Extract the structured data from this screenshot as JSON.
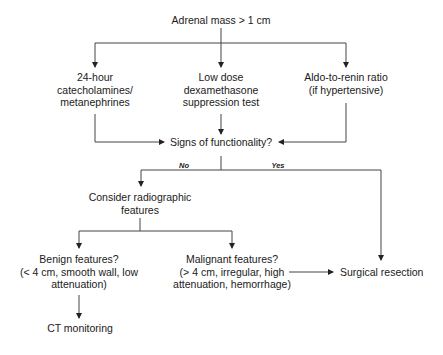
{
  "diagram": {
    "type": "flowchart",
    "nodes": {
      "start": {
        "lines": [
          "Adrenal mass > 1 cm"
        ]
      },
      "catechol": {
        "lines": [
          "24-hour",
          "catecholamines/",
          "metanephrines"
        ]
      },
      "dexa": {
        "lines": [
          "Low dose",
          "dexamethasone",
          "suppression test"
        ]
      },
      "aldo": {
        "lines": [
          "Aldo-to-renin ratio",
          "(if hypertensive)"
        ]
      },
      "functionality": {
        "lines": [
          "Signs of functionality?"
        ]
      },
      "radiographic": {
        "lines": [
          "Consider radiographic",
          "features"
        ]
      },
      "benign": {
        "lines": [
          "Benign features?",
          "(< 4 cm, smooth wall, low",
          "attenuation)"
        ]
      },
      "malignant": {
        "lines": [
          "Malignant features?",
          "(> 4 cm, irregular, high",
          "attenuation, hemorrhage)"
        ]
      },
      "surgery": {
        "lines": [
          "Surgical resection"
        ]
      },
      "ct": {
        "lines": [
          "CT monitoring"
        ]
      }
    },
    "edge_labels": {
      "no": "No",
      "yes": "Yes"
    },
    "edges": [
      {
        "from": "start",
        "to": "catechol"
      },
      {
        "from": "start",
        "to": "dexa"
      },
      {
        "from": "start",
        "to": "aldo"
      },
      {
        "from": "catechol",
        "to": "functionality"
      },
      {
        "from": "dexa",
        "to": "functionality"
      },
      {
        "from": "aldo",
        "to": "functionality"
      },
      {
        "from": "functionality",
        "to": "radiographic",
        "label": "No"
      },
      {
        "from": "functionality",
        "to": "surgery",
        "label": "Yes"
      },
      {
        "from": "radiographic",
        "to": "benign"
      },
      {
        "from": "radiographic",
        "to": "malignant"
      },
      {
        "from": "malignant",
        "to": "surgery"
      },
      {
        "from": "benign",
        "to": "ct"
      }
    ],
    "line_color": "#333333"
  }
}
